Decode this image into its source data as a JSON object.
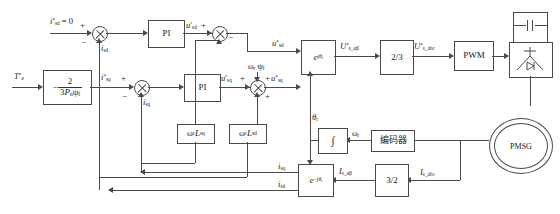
{
  "diagram": {
    "d_axis": {
      "ref_label": "i*sd = 0",
      "feedback_label": "isd",
      "controller_label": "PI",
      "pi_out_label": "u'sd",
      "decouple_label": "ωr Lsq",
      "out_label": "u*sd"
    },
    "q_axis": {
      "torque_ref_label": "T*e",
      "torque_block": {
        "num": "2",
        "den": "3Pnψf",
        "sign": "−"
      },
      "ref_label": "i*sq",
      "feedback_label": "isq",
      "controller_label": "PI",
      "pi_out_label": "u'sq",
      "emf_label": "ωr ψf",
      "decouple_label": "ωr Lsd",
      "out_label": "u*sq"
    },
    "forward_path": {
      "park_inv_label": "e^{jθr}",
      "alphabeta_label": "U*s_αβ",
      "two_three_label": "2/3",
      "abc_label": "U*s_abc",
      "pwm_label": "PWM"
    },
    "feedback_path": {
      "park_label": "e^{−jθr}",
      "alphabeta_label": "Is_αβ",
      "three_two_label": "3/2",
      "abc_label": "Is_abc"
    },
    "position": {
      "theta_label": "θr",
      "integrator_label": "∫",
      "speed_label": "ωr",
      "encoder_label": "编码器"
    },
    "machine": {
      "label": "PMSG"
    },
    "signs": {
      "plus": "+",
      "minus": "−"
    },
    "colors": {
      "line": "#4a4a4a",
      "text": "#1a1a1a",
      "background": "#ffffff"
    }
  }
}
